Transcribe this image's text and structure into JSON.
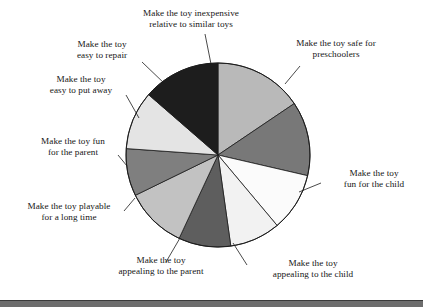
{
  "figure": {
    "background_color": "#ffffff",
    "outline_color": "#1c1c1c",
    "footer_rule_color": "#6d6d6d"
  },
  "chart_data": {
    "type": "pie",
    "title": "",
    "subtitle": "",
    "xlabel": "",
    "ylabel": "",
    "grid": false,
    "legend_position": "none",
    "labels_position": "outside-callout",
    "start_angle_deg": 0,
    "direction": "clockwise",
    "center_px": {
      "x": 218,
      "y": 155
    },
    "radius_px": 92,
    "categories": [
      "Make the toy safe for preschoolers",
      "Make the toy fun for the child",
      "Make the toy appealing to the child",
      "Make the toy appealing to the parent",
      "Make the toy playable for a long time",
      "Make the toy fun for the parent",
      "Make the toy easy to put away",
      "Make the toy easy to repair",
      "Make the toy inexpensive relative to similar toys"
    ],
    "values": [
      56,
      47,
      37,
      32,
      33,
      39,
      30,
      37,
      49
    ],
    "units": "degrees of arc",
    "slices": [
      {
        "label": "Make the toy safe for preschoolers",
        "label_lines": [
          "Make the toy safe for",
          "preschoolers"
        ],
        "start_deg": 0,
        "end_deg": 56,
        "sweep_deg": 56,
        "color": "#b9b9b9"
      },
      {
        "label": "Make the toy fun for the child",
        "label_lines": [
          "Make the toy",
          "fun for the child"
        ],
        "start_deg": 56,
        "end_deg": 103,
        "sweep_deg": 47,
        "color": "#787878"
      },
      {
        "label": "Make the toy appealing to the child",
        "label_lines": [
          "Make the toy",
          "appealing to the child"
        ],
        "start_deg": 103,
        "end_deg": 140,
        "sweep_deg": 37,
        "color": "#fbfbfb"
      },
      {
        "label": "Make the toy appealing to the parent",
        "label_lines": [
          "Make the toy",
          "appealing to the parent"
        ],
        "start_deg": 140,
        "end_deg": 172,
        "sweep_deg": 32,
        "color": "#f2f2f2"
      },
      {
        "label": "Make the toy playable for a long time",
        "label_lines": [
          "Make the toy playable",
          "for a long time"
        ],
        "start_deg": 172,
        "end_deg": 205,
        "sweep_deg": 33,
        "color": "#5e5e5e"
      },
      {
        "label": "Make the toy fun for the parent",
        "label_lines": [
          "Make the toy fun",
          "for the parent"
        ],
        "start_deg": 205,
        "end_deg": 244,
        "sweep_deg": 39,
        "color": "#c2c2c2"
      },
      {
        "label": "Make the toy easy to put away",
        "label_lines": [
          "Make the toy",
          "easy to put away"
        ],
        "start_deg": 244,
        "end_deg": 274,
        "sweep_deg": 30,
        "color": "#7f7f7f"
      },
      {
        "label": "Make the toy easy to repair",
        "label_lines": [
          "Make the toy",
          "easy to repair"
        ],
        "start_deg": 274,
        "end_deg": 311,
        "sweep_deg": 37,
        "color": "#e4e4e4"
      },
      {
        "label": "Make the toy inexpensive relative to similar toys",
        "label_lines": [
          "Make the toy inexpensive",
          "relative to similar toys"
        ],
        "start_deg": 311,
        "end_deg": 360,
        "sweep_deg": 49,
        "color": "#1d1d1d"
      }
    ]
  },
  "labels": {
    "inexpensive": "Make the toy inexpensive\nrelative to similar toys",
    "safe": "Make the toy safe for\npreschoolers",
    "fun_child": "Make the toy\nfun for the child",
    "appealing_child": "Make the toy\nappealing to the child",
    "appealing_parent": "Make the toy\nappealing to the parent",
    "playable": "Make the toy playable\nfor a long time",
    "fun_parent": "Make the toy fun\nfor the parent",
    "put_away": "Make the toy\neasy to put away",
    "repair": "Make the toy\neasy to repair"
  }
}
